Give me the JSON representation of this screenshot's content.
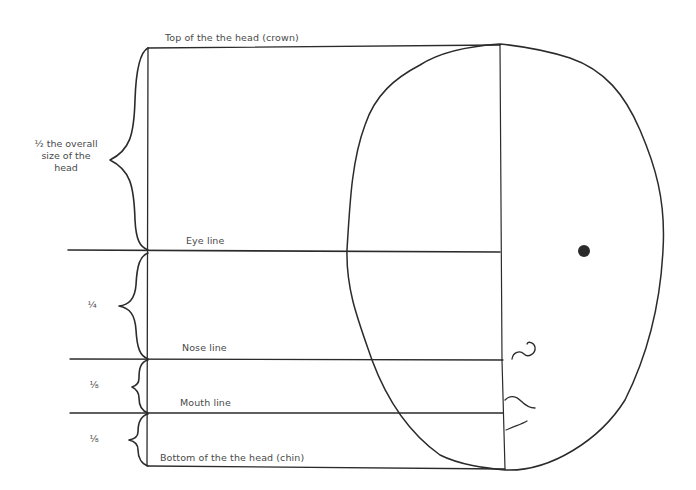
{
  "diagram": {
    "type": "head proportion guide (profile)",
    "lines": {
      "top": "Top of the the head (crown)",
      "eye": "Eye line",
      "nose": "Nose line",
      "mouth": "Mouth line",
      "bottom": "Bottom of the the head (chin)"
    },
    "brackets": {
      "crown_to_eye": "½ the overall size of the head",
      "crown_to_eye_lines": [
        "½ the overall",
        "size of the",
        "head"
      ],
      "eye_to_nose": "¼",
      "nose_to_mouth": "⅛",
      "mouth_to_chin": "⅛"
    },
    "stroke_color": "#2b2b2b",
    "text_color": "#4a4a4a"
  }
}
